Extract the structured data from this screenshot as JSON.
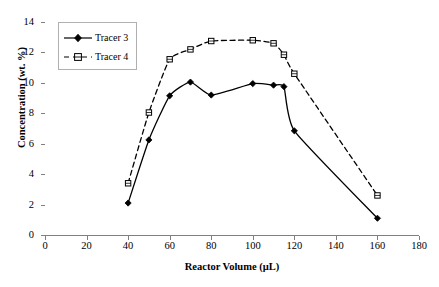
{
  "chart_data": {
    "type": "line",
    "title": "",
    "xlabel": "Reactor Volume (µL)",
    "ylabel": "Concentration (wt. %)",
    "xlim": [
      0,
      180
    ],
    "ylim": [
      0,
      14
    ],
    "xticks": [
      0,
      20,
      40,
      60,
      80,
      100,
      120,
      140,
      160,
      180
    ],
    "yticks": [
      0,
      2,
      4,
      6,
      8,
      10,
      12,
      14
    ],
    "grid": "horizontal",
    "legend_position": "upper-left",
    "series": [
      {
        "name": "Tracer 3",
        "line_style": "solid",
        "marker": "filled-diamond",
        "color": "#000000",
        "x": [
          40,
          50,
          60,
          70,
          80,
          100,
          110,
          115,
          120,
          160
        ],
        "values": [
          2.1,
          6.25,
          9.15,
          10.05,
          9.2,
          9.95,
          9.85,
          9.75,
          6.85,
          1.1
        ]
      },
      {
        "name": "Tracer 4",
        "line_style": "dashed",
        "marker": "open-square",
        "color": "#000000",
        "x": [
          40,
          50,
          60,
          70,
          80,
          100,
          110,
          115,
          120,
          160
        ],
        "values": [
          3.4,
          8.05,
          11.55,
          12.2,
          12.75,
          12.8,
          12.6,
          11.85,
          10.6,
          2.6
        ]
      }
    ]
  },
  "axes": {
    "y_tick_labels": [
      "0",
      "2",
      "4",
      "6",
      "8",
      "10",
      "12",
      "14"
    ],
    "x_tick_labels": [
      "0",
      "20",
      "40",
      "60",
      "80",
      "100",
      "120",
      "140",
      "160",
      "180"
    ],
    "y_title": "Concentration (wt. %)",
    "x_title": "Reactor Volume (µL)"
  },
  "legend": {
    "entries": [
      {
        "label": "Tracer 3"
      },
      {
        "label": "Tracer 4"
      }
    ]
  }
}
